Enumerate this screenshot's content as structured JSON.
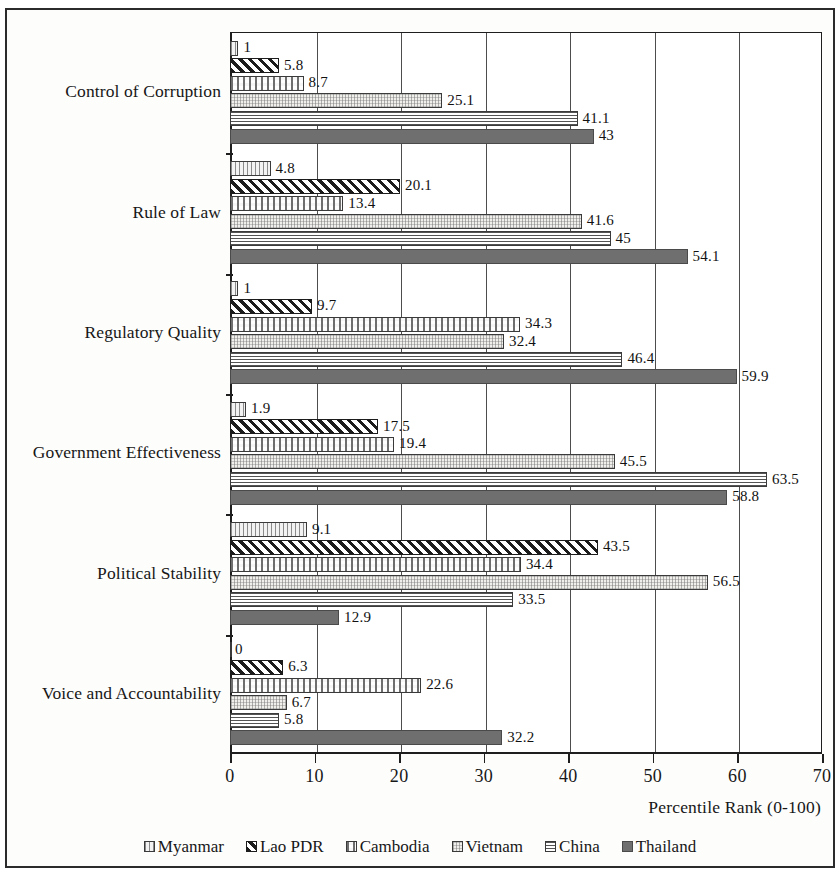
{
  "chart_data": {
    "type": "bar",
    "orientation": "horizontal",
    "title": "",
    "xlabel": "Percentile Rank (0-100)",
    "ylabel": "",
    "xlim": [
      0,
      70
    ],
    "xticks": [
      0,
      10,
      20,
      30,
      40,
      50,
      60,
      70
    ],
    "grid": true,
    "legend_position": "bottom",
    "categories": [
      "Control of Corruption",
      "Rule of Law",
      "Regulatory Quality",
      "Government Effectiveness",
      "Political Stability",
      "Voice and Accountability"
    ],
    "series": [
      {
        "name": "Myanmar",
        "pattern": "vertical-lines",
        "values": [
          1,
          4.8,
          1,
          1.9,
          9.1,
          0
        ],
        "labels": [
          "1",
          "4.8",
          "1",
          "1.9",
          "9.1",
          "0"
        ]
      },
      {
        "name": "Lao PDR",
        "pattern": "diagonal-hatch",
        "values": [
          5.8,
          20.1,
          9.7,
          17.5,
          43.5,
          6.3
        ],
        "labels": [
          "5.8",
          "20.1",
          "9.7",
          "17.5",
          "43.5",
          "6.3"
        ]
      },
      {
        "name": "Cambodia",
        "pattern": "dotted",
        "values": [
          8.7,
          13.4,
          34.3,
          19.4,
          34.4,
          22.6
        ],
        "labels": [
          "8.7",
          "13.4",
          "34.3",
          "19.4",
          "34.4",
          "22.6"
        ]
      },
      {
        "name": "Vietnam",
        "pattern": "stipple",
        "values": [
          25.1,
          41.6,
          32.4,
          45.5,
          56.5,
          6.7
        ],
        "labels": [
          "25.1",
          "41.6",
          "32.4",
          "45.5",
          "56.5",
          "6.7"
        ]
      },
      {
        "name": "China",
        "pattern": "horizontal-lines",
        "values": [
          41.1,
          45,
          46.4,
          63.5,
          33.5,
          5.8
        ],
        "labels": [
          "41.1",
          "45",
          "46.4",
          "63.5",
          "33.5",
          "5.8"
        ]
      },
      {
        "name": "Thailand",
        "pattern": "solid-gray",
        "values": [
          43,
          54.1,
          59.9,
          58.8,
          12.9,
          32.2
        ],
        "labels": [
          "43",
          "54.1",
          "59.9",
          "58.8",
          "12.9",
          "32.2"
        ]
      }
    ]
  },
  "axis": {
    "x_title": "Percentile Rank (0-100)",
    "tick_labels": [
      "0",
      "10",
      "20",
      "30",
      "40",
      "50",
      "60",
      "70"
    ]
  },
  "colors": {
    "frame": "#2b2b2b",
    "axis": "#1e1e1e",
    "grid": "#4d4d4d",
    "thailand_fill": "#6f6f6f",
    "text": "#171717",
    "background": "#ffffff"
  }
}
